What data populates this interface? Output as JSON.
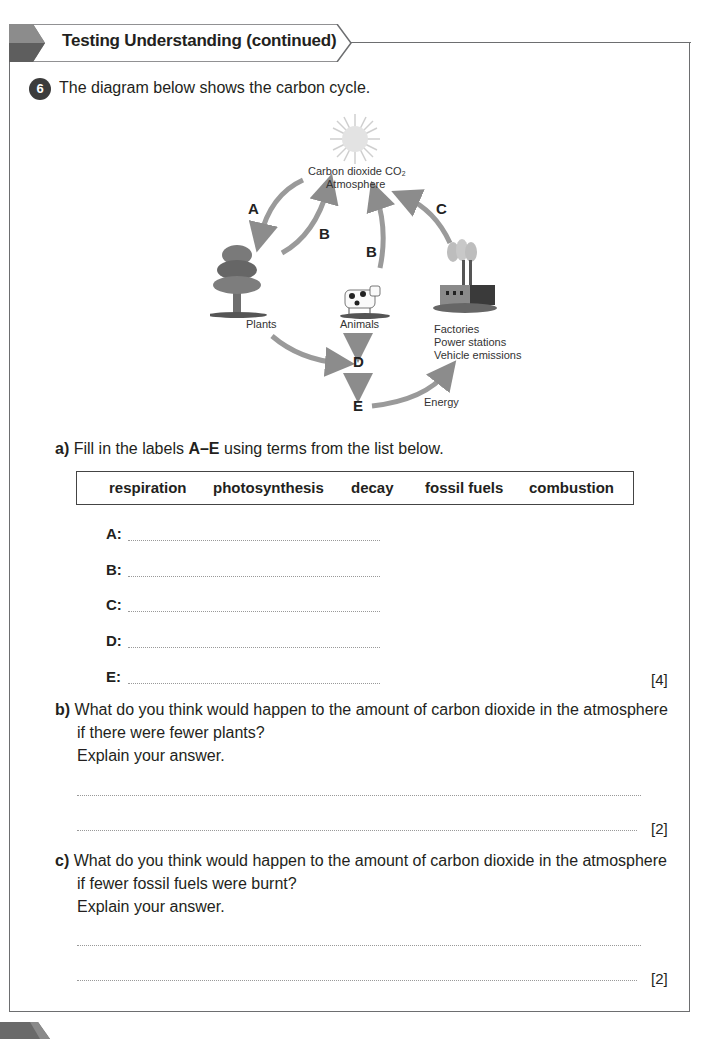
{
  "header": {
    "title": "Testing Understanding (continued)"
  },
  "question": {
    "number": "6",
    "intro": "The diagram below shows the carbon cycle."
  },
  "diagram": {
    "atmosphere_line1": "Carbon dioxide CO₂",
    "atmosphere_line2": "Atmosphere",
    "plants_label": "Plants",
    "animals_label": "Animals",
    "factories_line1": "Factories",
    "factories_line2": "Power stations",
    "factories_line3": "Vehicle emissions",
    "energy_label": "Energy",
    "letters": {
      "a": "A",
      "b1": "B",
      "b2": "B",
      "c": "C",
      "d": "D",
      "e": "E"
    },
    "icons": [
      "sun-icon",
      "tree-icon",
      "cow-icon",
      "factory-icon"
    ],
    "arrow_color": "#9a9a9a"
  },
  "part_a": {
    "label": "a)",
    "text_before": "Fill in the labels ",
    "text_bold": "A–E",
    "text_after": " using terms from the list below.",
    "terms": [
      "respiration",
      "photosynthesis",
      "decay",
      "fossil fuels",
      "combustion"
    ],
    "answers": [
      {
        "letter": "A:",
        "value": ""
      },
      {
        "letter": "B:",
        "value": ""
      },
      {
        "letter": "C:",
        "value": ""
      },
      {
        "letter": "D:",
        "value": ""
      },
      {
        "letter": "E:",
        "value": ""
      }
    ],
    "marks": "[4]"
  },
  "part_b": {
    "label": "b)",
    "line1": "What do you think would happen to the amount of carbon dioxide in the atmosphere",
    "line2": "if there were fewer plants?",
    "line3": "Explain your answer.",
    "marks": "[2]"
  },
  "part_c": {
    "label": "c)",
    "line1": "What do you think would happen to the amount of carbon dioxide in the atmosphere",
    "line2": "if fewer fossil fuels were burnt?",
    "line3": "Explain your answer.",
    "marks": "[2]"
  }
}
